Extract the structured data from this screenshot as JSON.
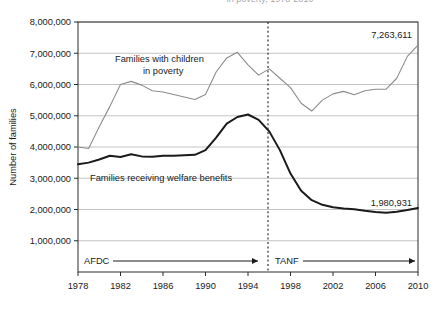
{
  "title_partial": "in poverty, 1978-2010",
  "axes": {
    "y_axis_title": "Number of families",
    "y_ticks": [
      "1,000,000",
      "2,000,000",
      "3,000,000",
      "4,000,000",
      "5,000,000",
      "6,000,000",
      "7,000,000",
      "8,000,000"
    ],
    "x_ticks": [
      "1978",
      "1982",
      "1986",
      "1990",
      "1994",
      "1998",
      "2002",
      "2006",
      "2010"
    ]
  },
  "annotations": {
    "poverty_label_line1": "Families with children",
    "poverty_label_line2": "in poverty",
    "welfare_label": "Families receiving welfare benefits",
    "poverty_end_value": "7,263,611",
    "welfare_end_value": "1,980,931",
    "era_afdc": "AFDC",
    "era_tanf": "TANF"
  },
  "colors": {
    "poverty_line": "#8c8c8c",
    "welfare_line": "#1a1a1a",
    "gridline": "#b5b5b5",
    "axis": "#2b2b2b",
    "divider": "#333333"
  },
  "chart_data": {
    "type": "line",
    "title": "in poverty, 1978-2010",
    "xlabel": "",
    "ylabel": "Number of families",
    "xlim": [
      1978,
      2010
    ],
    "ylim": [
      0,
      8000000
    ],
    "grid": true,
    "legend": "inline-annotations",
    "x": [
      1978,
      1979,
      1980,
      1981,
      1982,
      1983,
      1984,
      1985,
      1986,
      1987,
      1988,
      1989,
      1990,
      1991,
      1992,
      1993,
      1994,
      1995,
      1996,
      1997,
      1998,
      1999,
      2000,
      2001,
      2002,
      2003,
      2004,
      2005,
      2006,
      2007,
      2008,
      2009,
      2010
    ],
    "series": [
      {
        "name": "Families with children in poverty",
        "color": "#8c8c8c",
        "values": [
          4000000,
          3950000,
          4650000,
          5300000,
          6000000,
          6100000,
          5980000,
          5800000,
          5760000,
          5680000,
          5600000,
          5520000,
          5680000,
          6400000,
          6850000,
          7030000,
          6630000,
          6300000,
          6500000,
          6200000,
          5900000,
          5400000,
          5150000,
          5500000,
          5700000,
          5780000,
          5670000,
          5800000,
          5850000,
          5850000,
          6200000,
          6900000,
          7263611
        ]
      },
      {
        "name": "Families receiving welfare benefits",
        "color": "#1a1a1a",
        "values": [
          3450000,
          3500000,
          3600000,
          3720000,
          3680000,
          3770000,
          3700000,
          3690000,
          3720000,
          3720000,
          3740000,
          3750000,
          3900000,
          4300000,
          4750000,
          4960000,
          5040000,
          4870000,
          4500000,
          3900000,
          3150000,
          2600000,
          2300000,
          2150000,
          2070000,
          2030000,
          2010000,
          1960000,
          1920000,
          1900000,
          1930000,
          1980931,
          2050000
        ]
      }
    ]
  }
}
